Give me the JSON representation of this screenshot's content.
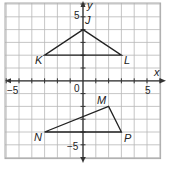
{
  "diagram": {
    "type": "coordinate-plane",
    "axes": {
      "x_label": "x",
      "y_label": "y",
      "x_ticks_labeled": [
        "-5",
        "0",
        "5"
      ],
      "y_ticks_labeled": [
        "5",
        "-5"
      ]
    },
    "grid": {
      "xmin": -6,
      "xmax": 6,
      "ymin": -6,
      "ymax": 6
    },
    "triangles": [
      {
        "name": "JKL",
        "vertices": [
          {
            "label": "J",
            "x": 0,
            "y": 4
          },
          {
            "label": "K",
            "x": -3,
            "y": 2
          },
          {
            "label": "L",
            "x": 3,
            "y": 2
          }
        ]
      },
      {
        "name": "MNP",
        "vertices": [
          {
            "label": "M",
            "x": 2,
            "y": -2
          },
          {
            "label": "N",
            "x": -3,
            "y": -4
          },
          {
            "label": "P",
            "x": 3,
            "y": -4
          }
        ]
      }
    ],
    "colors": {
      "grid": "#b8b8b8",
      "axis": "#333333",
      "lines": "#222222"
    }
  },
  "labels": {
    "x_axis": "x",
    "y_axis": "y",
    "tick_neg5_x": "−5",
    "tick_0": "0",
    "tick_5_x": "5",
    "tick_5_y": "5",
    "tick_neg5_y": "−5",
    "J": "J",
    "K": "K",
    "L": "L",
    "M": "M",
    "N": "N",
    "P": "P"
  }
}
